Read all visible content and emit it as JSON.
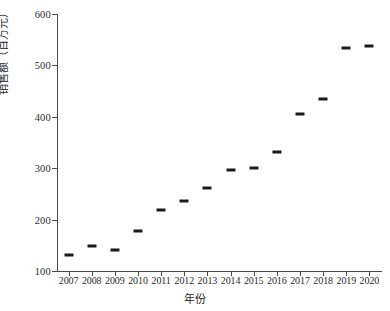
{
  "chart_data": {
    "type": "scatter",
    "title": "",
    "xlabel": "年份",
    "ylabel": "销售额（百万元）",
    "categories": [
      "2007",
      "2008",
      "2009",
      "2010",
      "2011",
      "2012",
      "2013",
      "2014",
      "2015",
      "2016",
      "2017",
      "2018",
      "2019",
      "2020"
    ],
    "x": [
      2007,
      2008,
      2009,
      2010,
      2011,
      2012,
      2013,
      2014,
      2015,
      2016,
      2017,
      2018,
      2019,
      2020
    ],
    "values": [
      132,
      148,
      141,
      177,
      219,
      236,
      262,
      296,
      301,
      332,
      406,
      435,
      534,
      537
    ],
    "series": [
      {
        "name": "销售额",
        "values": [
          132,
          148,
          141,
          177,
          219,
          236,
          262,
          296,
          301,
          332,
          406,
          435,
          534,
          537
        ]
      }
    ],
    "ylim": [
      100,
      600
    ],
    "xlim": [
      2006.5,
      2020.5
    ],
    "yticks": [
      100,
      200,
      300,
      400,
      500,
      600
    ],
    "ytick_labels": [
      "100",
      "200",
      "300",
      "400",
      "500",
      "600"
    ],
    "xtick_labels": [
      "2007",
      "2008",
      "2009",
      "2010",
      "2011",
      "2012",
      "2013",
      "2014",
      "2015",
      "2016",
      "2017",
      "2018",
      "2019",
      "2020"
    ],
    "grid": false,
    "legend": false,
    "marker": "horizontal-dash",
    "marker_color": "#1a1a1a",
    "axis_color": "#4a4a4a"
  }
}
